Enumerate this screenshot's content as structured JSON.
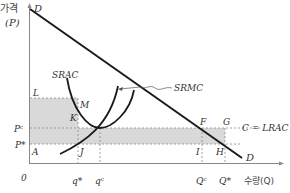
{
  "axes": {
    "y_label_kr": "가격",
    "y_label_sym": "(P)",
    "x_label": "수량(Q)",
    "origin": "0"
  },
  "curves": {
    "demand": "D",
    "demand_end": "D",
    "srac": "SRAC",
    "srmc": "SRMC",
    "lrac": "C = LRAC"
  },
  "price_labels": {
    "pc": "Pᶜ",
    "pstar": "P*"
  },
  "quantity_labels": {
    "qstar": "q*",
    "qc": "qᶜ",
    "Qc": "Qᶜ",
    "Qstar": "Q*"
  },
  "points": {
    "L": "L",
    "M": "M",
    "K": "K",
    "A": "A",
    "J": "J",
    "F": "F",
    "G": "G",
    "I": "I",
    "H": "H"
  },
  "colors": {
    "shade": "#d9d9d9",
    "line": "#1a1a1a",
    "axis": "#888888",
    "dash": "#8a8a8a"
  }
}
